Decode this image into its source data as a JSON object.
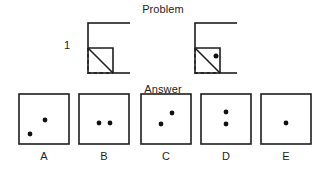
{
  "page": {
    "background_color": "#ffffff",
    "ink_color": "#1d1d1d",
    "width": 326,
    "height": 172
  },
  "problem": {
    "title": "Problem",
    "row_number": "1",
    "description": "Paper folding puzzle: a square sheet has its bottom-left corner folded up along a diagonal, then a hole is punched through the folded region.",
    "figures": [
      {
        "name": "fold-step",
        "caption": "",
        "square": {
          "x": 88,
          "y": 23,
          "size": 50
        },
        "fold": {
          "type": "bottom-left-corner-folded-up",
          "dashed_outline": {
            "x": 88,
            "y": 48,
            "width": 25,
            "height": 25
          },
          "diagonal_from": [
            88,
            48
          ],
          "diagonal_to": [
            113,
            73
          ],
          "flap_corner": [
            113,
            48
          ]
        },
        "dots": []
      },
      {
        "name": "punch-step",
        "caption": "",
        "square": {
          "x": 195,
          "y": 23,
          "size": 50
        },
        "fold": {
          "type": "bottom-left-corner-folded-up",
          "dashed_outline": {
            "x": 195,
            "y": 48,
            "width": 25,
            "height": 25
          },
          "diagonal_from": [
            195,
            48
          ],
          "diagonal_to": [
            220,
            73
          ],
          "flap_corner": [
            220,
            48
          ]
        },
        "dots": [
          {
            "cx": 216,
            "cy": 56,
            "r": 2.4
          }
        ]
      }
    ]
  },
  "answer": {
    "title": "Answer",
    "options": [
      {
        "label": "A",
        "box": {
          "x": 18,
          "y": 93,
          "size": 51
        },
        "dots": [
          {
            "cx": 0.52,
            "cy": 0.52
          },
          {
            "cx": 0.22,
            "cy": 0.8
          }
        ]
      },
      {
        "label": "B",
        "box": {
          "x": 78,
          "y": 93,
          "size": 51
        },
        "dots": [
          {
            "cx": 0.4,
            "cy": 0.56
          },
          {
            "cx": 0.62,
            "cy": 0.56
          }
        ]
      },
      {
        "label": "C",
        "box": {
          "x": 140,
          "y": 93,
          "size": 51
        },
        "dots": [
          {
            "cx": 0.62,
            "cy": 0.38
          },
          {
            "cx": 0.4,
            "cy": 0.58
          }
        ]
      },
      {
        "label": "D",
        "box": {
          "x": 200,
          "y": 93,
          "size": 51
        },
        "dots": [
          {
            "cx": 0.5,
            "cy": 0.36
          },
          {
            "cx": 0.5,
            "cy": 0.58
          }
        ]
      },
      {
        "label": "E",
        "box": {
          "x": 260,
          "y": 93,
          "size": 51
        },
        "dots": [
          {
            "cx": 0.5,
            "cy": 0.56
          }
        ]
      }
    ]
  }
}
